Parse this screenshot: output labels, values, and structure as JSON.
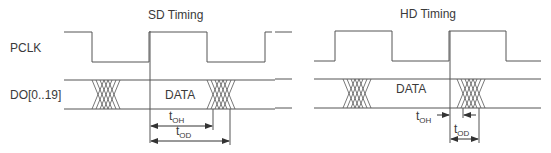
{
  "diagram": {
    "colors": {
      "line": "#555555",
      "text": "#3a3a3a",
      "background": "#ffffff"
    },
    "signals": {
      "clock": "PCLK",
      "data": "DO[0..19]"
    },
    "panels": [
      {
        "title": "SD Timing",
        "data_label": "DATA",
        "tOH": {
          "t": "t",
          "sub": "OH"
        },
        "tOD": {
          "t": "t",
          "sub": "OD"
        }
      },
      {
        "title": "HD Timing",
        "data_label": "DATA",
        "tOH": {
          "t": "t",
          "sub": "OH"
        },
        "tOD": {
          "t": "t",
          "sub": "OD"
        }
      }
    ]
  }
}
